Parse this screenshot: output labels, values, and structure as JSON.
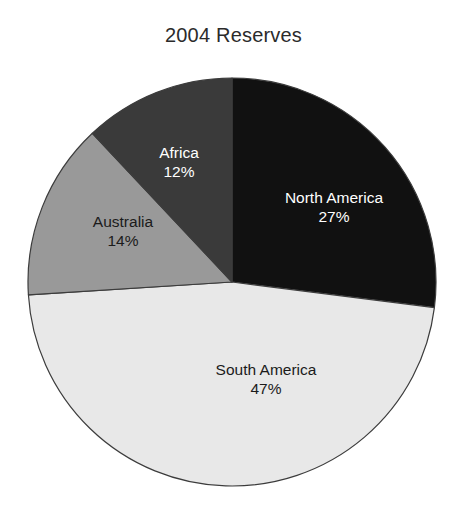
{
  "chart_data": {
    "type": "pie",
    "title": "2004 Reserves",
    "xlabel": "",
    "ylabel": "",
    "legend": "none",
    "grid": false,
    "labels": [
      "North America",
      "South America",
      "Australia",
      "Africa"
    ],
    "values": [
      27,
      47,
      14,
      12
    ],
    "value_unit": "%",
    "value_labels": [
      "27%",
      "47%",
      "14%",
      "12%"
    ],
    "colors": [
      "#111111",
      "#e8e8e8",
      "#999999",
      "#3a3a3a"
    ],
    "start_angle_deg": 0,
    "direction": "clockwise",
    "slices": [
      {
        "name": "North America",
        "value": 27,
        "value_label": "27%",
        "color": "#111111",
        "text_color": "#ffffff"
      },
      {
        "name": "South America",
        "value": 47,
        "value_label": "47%",
        "color": "#e8e8e8",
        "text_color": "#1b1b1b"
      },
      {
        "name": "Australia",
        "value": 14,
        "value_label": "14%",
        "color": "#999999",
        "text_color": "#1b1b1b"
      },
      {
        "name": "Africa",
        "value": 12,
        "value_label": "12%",
        "color": "#3a3a3a",
        "text_color": "#ffffff"
      }
    ]
  },
  "title": "2004 Reserves",
  "slice_labels": {
    "north_america": {
      "name": "North America",
      "value": "27%"
    },
    "south_america": {
      "name": "South America",
      "value": "47%"
    },
    "australia": {
      "name": "Australia",
      "value": "14%"
    },
    "africa": {
      "name": "Africa",
      "value": "12%"
    }
  },
  "outline_color": "#3c3c3c",
  "background_color": "#ffffff"
}
